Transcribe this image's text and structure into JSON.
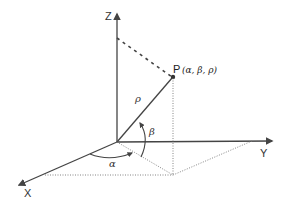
{
  "diagram": {
    "axes": {
      "z": {
        "label": "Z"
      },
      "y": {
        "label": "Y"
      },
      "x": {
        "label": "X"
      }
    },
    "point": {
      "name": "P",
      "coords": "(α, β, ρ)"
    },
    "labels": {
      "rho": "ρ",
      "beta": "β",
      "alpha": "α"
    },
    "colors": {
      "line": "#444444",
      "dotted": "#666666",
      "text": "#333333",
      "background": "#ffffff"
    }
  }
}
